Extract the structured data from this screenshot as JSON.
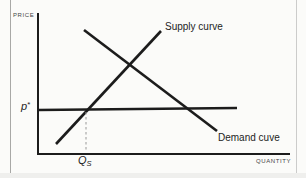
{
  "figure": {
    "background_color": "#fbfbf9",
    "line_color": "#1c1c1c",
    "dashed_line_color": "#999999",
    "axes": {
      "y_label": "PRICE",
      "x_label": "QUANTITY"
    },
    "curves": [
      {
        "id": "supply",
        "label": "Supply curve"
      },
      {
        "id": "demand",
        "label": "Demand cuve"
      }
    ],
    "markers": {
      "price_symbol": "p",
      "price_superscript": "*",
      "quantity_symbol": "Q",
      "quantity_subscript": "S"
    }
  }
}
